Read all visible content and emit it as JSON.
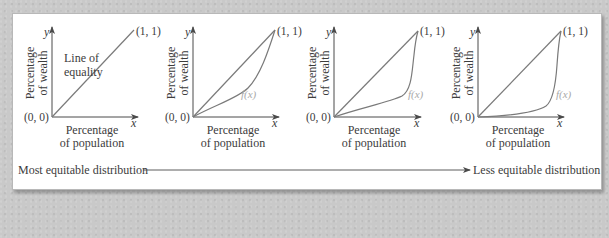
{
  "figure": {
    "colors": {
      "background": "#c9c9c9",
      "panel": "#ffffff",
      "axis": "#4a4a4a",
      "curve": "#7a7a7a",
      "fx_label": "#a9a9a9",
      "text": "#3c3c3c"
    },
    "axis_labels": {
      "x_var": "x",
      "y_var": "y",
      "x_title_line1": "Percentage",
      "x_title_line2": "of population",
      "y_title_line1": "Percentage",
      "y_title_line2": "of wealth"
    },
    "points": {
      "origin": "(0, 0)",
      "end": "(1, 1)"
    },
    "panels": [
      {
        "id": 1,
        "annotation_line1": "Line of",
        "annotation_line2": "equality",
        "curve_label": ""
      },
      {
        "id": 2,
        "annotation_line1": "",
        "annotation_line2": "",
        "curve_label": "f(x)"
      },
      {
        "id": 3,
        "annotation_line1": "",
        "annotation_line2": "",
        "curve_label": "f(x)"
      },
      {
        "id": 4,
        "annotation_line1": "",
        "annotation_line2": "",
        "curve_label": "f(x)"
      }
    ],
    "bottom_scale": {
      "left_label": "Most equitable distribution",
      "right_label": "Less equitable distribution"
    }
  }
}
